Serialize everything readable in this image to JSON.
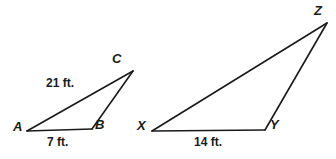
{
  "figure": {
    "background_color": "#ffffff",
    "stroke_color": "#1a1a1a",
    "text_color": "#1a1a1a",
    "width": 336,
    "height": 159
  },
  "triangles": [
    {
      "name": "triangle-ABC",
      "vertices": [
        {
          "label": "A",
          "x": 27,
          "y": 131
        },
        {
          "label": "B",
          "x": 92,
          "y": 129
        },
        {
          "label": "C",
          "x": 133,
          "y": 71
        }
      ],
      "sides": [
        {
          "name": "side-AC",
          "from": "A",
          "to": "C",
          "measure": "21 ft."
        },
        {
          "name": "side-AB",
          "from": "A",
          "to": "B",
          "measure": "7 ft."
        },
        {
          "name": "side-BC",
          "from": "B",
          "to": "C",
          "measure": ""
        }
      ]
    },
    {
      "name": "triangle-XYZ",
      "vertices": [
        {
          "label": "X",
          "x": 152,
          "y": 131
        },
        {
          "label": "Y",
          "x": 265,
          "y": 130
        },
        {
          "label": "Z",
          "x": 327,
          "y": 23
        }
      ],
      "sides": [
        {
          "name": "side-XZ",
          "from": "X",
          "to": "Z",
          "measure": ""
        },
        {
          "name": "side-XY",
          "from": "X",
          "to": "Y",
          "measure": "14 ft."
        },
        {
          "name": "side-YZ",
          "from": "Y",
          "to": "Z",
          "measure": ""
        }
      ]
    }
  ],
  "labels": {
    "A": "A",
    "B": "B",
    "C": "C",
    "X": "X",
    "Y": "Y",
    "Z": "Z",
    "side_AC": "21 ft.",
    "side_AB": "7 ft.",
    "side_XY": "14 ft."
  }
}
